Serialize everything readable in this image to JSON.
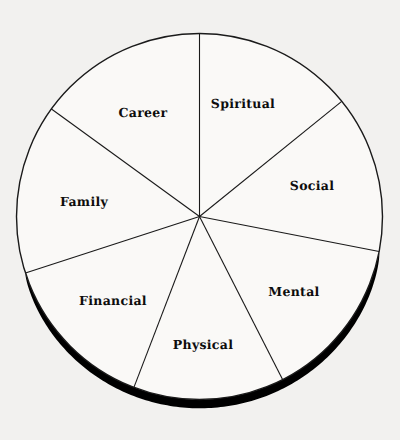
{
  "figure": {
    "name": "wheel-of-life-diagram",
    "type": "pie",
    "background_color": "#f2f1ef",
    "stroke_color": "#1a1a1a",
    "shadow_color": "#000000",
    "label_color": "#0d0d0d"
  },
  "chart_data": {
    "type": "pie",
    "title": "",
    "subtitle": "",
    "xlabel": "",
    "ylabel": "",
    "legend_position": "none",
    "grid": false,
    "center": {
      "x": 199.5,
      "y": 216.5
    },
    "radius": 183,
    "note": "Seven unequal wedges of a circle; each wedge labelled with a life area.",
    "categories": [
      "Spiritual",
      "Social",
      "Mental",
      "Physical",
      "Financial",
      "Family",
      "Career"
    ],
    "values": [
      14.2,
      13.9,
      14.4,
      13.3,
      14.2,
      15.0,
      15.0
    ],
    "slices": [
      {
        "label": "Spiritual",
        "start_angle": -90,
        "end_angle": -39,
        "sweep": 51,
        "percent": 14.2,
        "label_x": 243,
        "label_y": 104
      },
      {
        "label": "Social",
        "start_angle": -39,
        "end_angle": 11,
        "sweep": 50,
        "percent": 13.9,
        "label_x": 312,
        "label_y": 186
      },
      {
        "label": "Mental",
        "start_angle": 11,
        "end_angle": 63,
        "sweep": 52,
        "percent": 14.4,
        "label_x": 294,
        "label_y": 292
      },
      {
        "label": "Physical",
        "start_angle": 63,
        "end_angle": 111,
        "sweep": 48,
        "percent": 13.3,
        "label_x": 203,
        "label_y": 345
      },
      {
        "label": "Financial",
        "start_angle": 111,
        "end_angle": 162,
        "sweep": 51,
        "percent": 14.2,
        "label_x": 113,
        "label_y": 301
      },
      {
        "label": "Family",
        "start_angle": 162,
        "end_angle": -144,
        "sweep": 54,
        "percent": 15.0,
        "label_x": 84,
        "label_y": 202
      },
      {
        "label": "Career",
        "start_angle": -144,
        "end_angle": -90,
        "sweep": 54,
        "percent": 15.0,
        "label_x": 143,
        "label_y": 113
      }
    ],
    "shadow_arc": {
      "start_angle": 11,
      "end_angle": 162,
      "max_width": 9,
      "description": "thick tapering black drop-shadow along the lower-right to lower-left rim"
    }
  }
}
